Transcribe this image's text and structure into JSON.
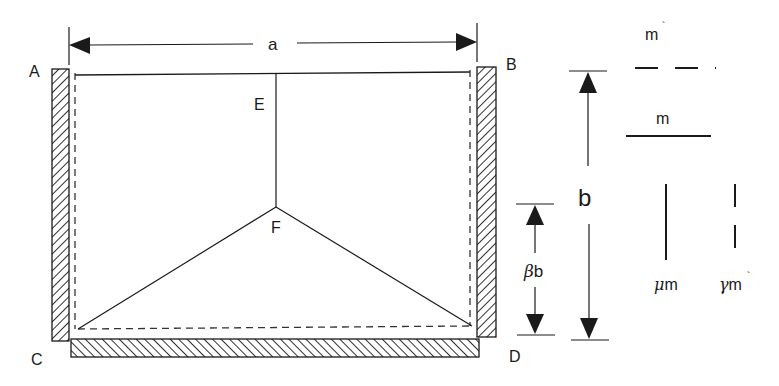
{
  "diagram": {
    "type": "slab-yield-line-schematic",
    "corner_labels": {
      "A": "A",
      "B": "B",
      "C": "C",
      "D": "D"
    },
    "point_labels": {
      "E": "E",
      "F": "F"
    },
    "dimensions": {
      "width_label": "a",
      "height_label": "b",
      "partial_height_label": "b",
      "partial_height_prefix": "β"
    },
    "legend": {
      "items": [
        {
          "symbol": "horizontal-dashed-line",
          "label": "m",
          "mark": "`"
        },
        {
          "symbol": "horizontal-solid-line",
          "label": "m",
          "mark": ""
        },
        {
          "symbol": "vertical-solid-line",
          "prefix": "μ",
          "label": "m",
          "mark": ""
        },
        {
          "symbol": "vertical-dashed-line",
          "prefix": "γ",
          "label": "m",
          "mark": "`"
        }
      ]
    },
    "colors": {
      "line": "#1a1a1a",
      "background": "#ffffff"
    }
  }
}
